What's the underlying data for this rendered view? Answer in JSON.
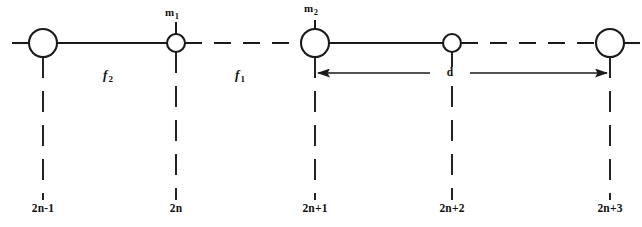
{
  "figure": {
    "stroke_color": "#1a1a1a",
    "background_color": "#ffffff",
    "baseline_y": 43
  },
  "sites": [
    {
      "id": "2n-1",
      "label": "2n-1",
      "x": 43,
      "type": "large-mass",
      "radius": 14,
      "has_mass_tick": false,
      "mass_label": ""
    },
    {
      "id": "2n",
      "label": "2n",
      "x": 176,
      "type": "small-mass",
      "radius": 9,
      "has_mass_tick": true,
      "mass_label": "m",
      "mass_sub": "1"
    },
    {
      "id": "2n+1",
      "label": "2n+1",
      "x": 315,
      "type": "large-mass",
      "radius": 14,
      "has_mass_tick": true,
      "mass_label": "m",
      "mass_sub": "2"
    },
    {
      "id": "2n+2",
      "label": "2n+2",
      "x": 452,
      "type": "small-mass",
      "radius": 9,
      "has_mass_tick": false,
      "mass_label": ""
    },
    {
      "id": "2n+3",
      "label": "2n+3",
      "x": 610,
      "type": "large-mass",
      "radius": 14,
      "has_mass_tick": false,
      "mass_label": ""
    }
  ],
  "bonds": [
    {
      "id": "bond-left-stub",
      "from_x": 12,
      "to_x": 29,
      "style": "dashed"
    },
    {
      "id": "bond-2n-1_2n",
      "from_x": 57,
      "to_x": 167,
      "style": "solid",
      "spring_label": "f",
      "spring_sub": "2",
      "label_x": 102
    },
    {
      "id": "bond-2n_2n+1",
      "from_x": 185,
      "to_x": 301,
      "style": "dashed",
      "spring_label": "f",
      "spring_sub": "1",
      "label_x": 237
    },
    {
      "id": "bond-2n+1_2n+2",
      "from_x": 329,
      "to_x": 443,
      "style": "solid",
      "spring_label": "",
      "label_x": 0
    },
    {
      "id": "bond-2n+2_2n+3",
      "from_x": 461,
      "to_x": 596,
      "style": "dashed",
      "spring_label": "",
      "label_x": 0
    },
    {
      "id": "bond-right-stub",
      "from_x": 624,
      "to_x": 640,
      "style": "dashed"
    }
  ],
  "guidelines": [
    {
      "id": "guide-2n-1",
      "x": 43,
      "from_y": 57,
      "to_y": 200
    },
    {
      "id": "guide-2n",
      "x": 176,
      "from_y": 52,
      "to_y": 200
    },
    {
      "id": "guide-2n+1",
      "x": 315,
      "from_y": 57,
      "to_y": 200
    },
    {
      "id": "guide-2n+2",
      "x": 452,
      "from_y": 52,
      "to_y": 200
    },
    {
      "id": "guide-2n+3",
      "x": 610,
      "from_y": 57,
      "to_y": 200
    }
  ],
  "mass_ticks": [
    {
      "id": "tick-m1",
      "x": 176,
      "from_y": 22,
      "to_y": 34
    },
    {
      "id": "tick-m2",
      "x": 315,
      "from_y": 20,
      "to_y": 29
    }
  ],
  "mass_labels": [
    {
      "id": "m1",
      "text": "m",
      "sub": "1",
      "x": 172,
      "y": 9
    },
    {
      "id": "m2",
      "text": "m",
      "sub": "2",
      "x": 311,
      "y": 5
    }
  ],
  "spring_labels": [
    {
      "id": "f2",
      "text": "f",
      "sub": "2",
      "x": 108,
      "y": 69
    },
    {
      "id": "f1",
      "text": "f",
      "sub": "1",
      "x": 240,
      "y": 69
    }
  ],
  "dimension": {
    "id": "lattice-constant",
    "label": "d",
    "label_x": 450,
    "label_y": 67,
    "y": 73,
    "from_x": 316,
    "to_x": 609,
    "arrowheads": "both"
  },
  "site_labels_y": 209
}
